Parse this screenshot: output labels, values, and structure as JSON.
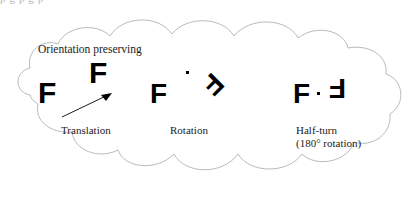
{
  "figure": {
    "cut_off_top_text": "p g p g p",
    "heading": "Orientation preserving",
    "outline_color": "#a8a8a8",
    "glyph_color": "#000000",
    "background_color": "#ffffff"
  },
  "panels": [
    {
      "id": "translation",
      "caption": "Translation",
      "caption_line2": "",
      "source_glyph": "F",
      "image_glyph": "F",
      "transform": "translation",
      "rotation_degrees": 0,
      "has_arrow": true,
      "has_center_dot": false
    },
    {
      "id": "rotation",
      "caption": "Rotation",
      "caption_line2": "",
      "source_glyph": "F",
      "image_glyph": "F",
      "transform": "rotation",
      "rotation_degrees": 135,
      "has_arrow": false,
      "has_center_dot": true
    },
    {
      "id": "half-turn",
      "caption": "Half-turn",
      "caption_line2": "(180° rotation)",
      "source_glyph": "F",
      "image_glyph": "F",
      "transform": "half-turn",
      "rotation_degrees": 180,
      "has_arrow": false,
      "has_center_dot": true
    }
  ]
}
